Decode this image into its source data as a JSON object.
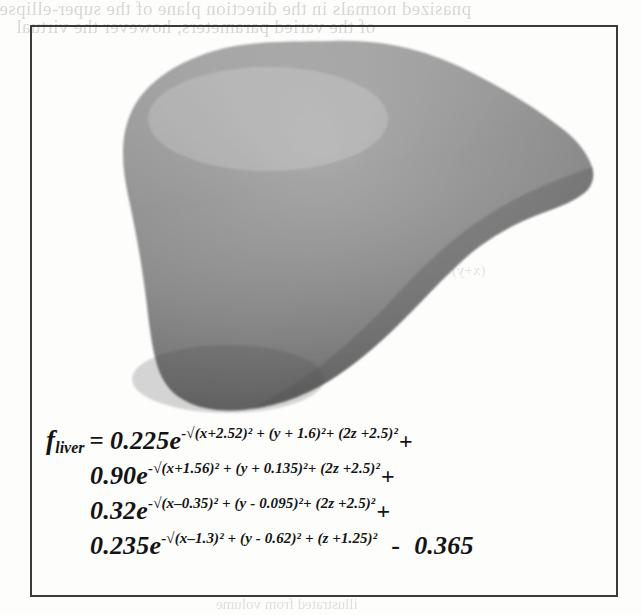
{
  "page": {
    "width": 642,
    "height": 615,
    "background_color": "#fdfdfc",
    "frame_border_color": "#3a3a3a"
  },
  "ghost_text": {
    "note": "faint show-through text from the facing/underlying printed page",
    "top_line_1": "pnasized normals in the direction plane of the super-ellipse.",
    "top_line_2": "of the varied parameters, however the virtual",
    "mid_right_1": "(x+y)",
    "mid_right_2": "and form",
    "bottom_line": "illustrated from  volume"
  },
  "figure": {
    "name": "liver-implicit-surface-render",
    "caption_absent": true,
    "render": {
      "type": "shaded-3d-blob",
      "subject": "liver",
      "fill_light": "#9d9d9d",
      "fill_mid": "#8a8a8a",
      "fill_dark": "#6d6d6d",
      "edge": "#5d5d5d"
    }
  },
  "equation": {
    "function_name": "f",
    "function_subscript": "liver",
    "equals": "=",
    "lines": [
      {
        "id": "term-1",
        "coefficient": "0.225",
        "base": "e",
        "exponent_prefix": "-",
        "radical": "√",
        "exponent_body": "(x+2.52)² + (y + 1.6)²+ (2z +2.5)²",
        "trailing_operator": "+"
      },
      {
        "id": "term-2",
        "coefficient": "0.90",
        "base": "e",
        "exponent_prefix": "-",
        "radical": "√",
        "exponent_body": "(x+1.56)² + (y + 0.135)²+ (2z +2.5)²",
        "trailing_operator": "+"
      },
      {
        "id": "term-3",
        "coefficient": "0.32",
        "base": "e",
        "exponent_prefix": "-",
        "radical": "√",
        "exponent_body": "(x–0.35)² + (y - 0.095)²+ (2z +2.5)²",
        "trailing_operator": "+"
      },
      {
        "id": "term-4",
        "coefficient": "0.235",
        "base": "e",
        "exponent_prefix": "-",
        "radical": "√",
        "exponent_body": "(x–1.3)² + (y - 0.62)² + (z +1.25)²",
        "trailing_operator": "",
        "constant_operator": "-",
        "constant_value": "0.365"
      }
    ]
  }
}
